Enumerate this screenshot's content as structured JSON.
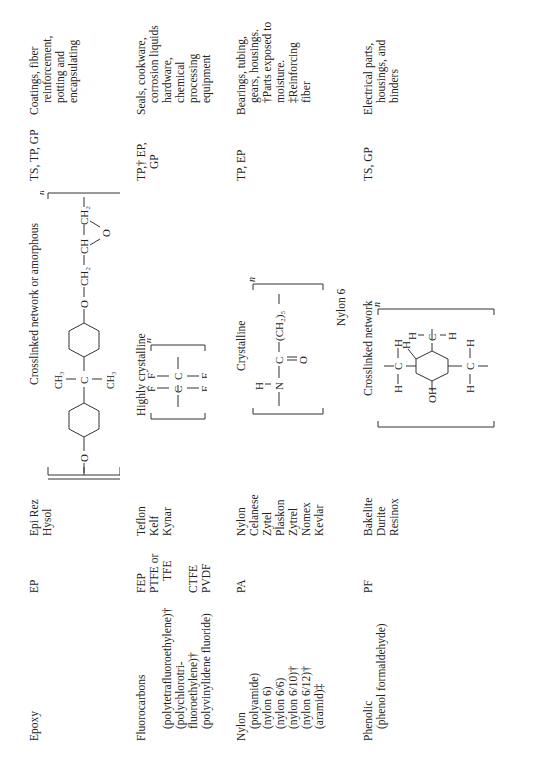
{
  "rows": [
    {
      "material": "Epoxy",
      "material_sub": [],
      "abbreviations": [
        "EP"
      ],
      "trade_names": [
        "Epi Rez",
        "Hysol"
      ],
      "structure_label": "Crosslinked network or amorphous",
      "type": "TS, TP, GP",
      "uses": [
        "Coatings, fiber",
        "reinforcement,",
        "potting and",
        "encapsulating"
      ]
    },
    {
      "material": "Fluorocarbons",
      "material_sub": [
        "(polytetrafluoroethylene)†",
        "(polychlorotri-",
        "fluoroethylene)†",
        "(polyvinylidene fluoride)"
      ],
      "abbreviations": [
        "FEP",
        "PTFE or",
        "TFE",
        "",
        "CTFE",
        "PVDF"
      ],
      "trade_names": [
        "Teflon",
        "Kelf",
        "Kynar"
      ],
      "structure_label": "Highly crystalline",
      "type": [
        "TP,† EP,",
        "GP"
      ],
      "uses": [
        "Seals, cookware,",
        "corrosion liquids",
        "hardware,",
        "chemical",
        "processing",
        "equipment"
      ]
    },
    {
      "material": "Nylon",
      "material_sub": [
        "(polyamide)",
        "(nylon 6)",
        "(nylon 6/6)",
        "(nylon 6/10)†",
        "(nylon 6/12)†",
        "(aramid)‡"
      ],
      "abbreviations": [
        "PA"
      ],
      "trade_names": [
        "Nylon",
        "Celanese",
        "Zytel",
        "Plaskon",
        "Zytrel",
        "Nomex",
        "Kevlar"
      ],
      "structure_label": "Crystalline",
      "structure_caption": "Nylon 6",
      "type": "TP, EP",
      "uses": [
        "Bearings, tubing,",
        "gears, housings.",
        "†Parts exposed to",
        "moisture.",
        "‡Reinforcing",
        "fiber"
      ]
    },
    {
      "material": "Phenolic",
      "material_sub": [
        "(phenol formaldehyde)"
      ],
      "abbreviations": [
        "PF"
      ],
      "trade_names": [
        "Bakelite",
        "Durite",
        "Resinox"
      ],
      "structure_label": "Crosslinked network",
      "type": "TS, GP",
      "uses": [
        "Electrical parts,",
        "housings, and",
        "binders"
      ]
    }
  ],
  "formula": {
    "repeat_n": "n",
    "epoxy": {
      "ch3": "CH3",
      "c": "C",
      "o": "O",
      "ch2": "CH2",
      "ch": "CH"
    },
    "ptfe": {
      "f": "F",
      "c": "C"
    },
    "nylon": {
      "h": "H",
      "n": "N",
      "c": "C",
      "o": "O",
      "chain": "(CH2)5"
    },
    "phenolic": {
      "oh": "OH",
      "h": "H",
      "c": "C"
    }
  }
}
